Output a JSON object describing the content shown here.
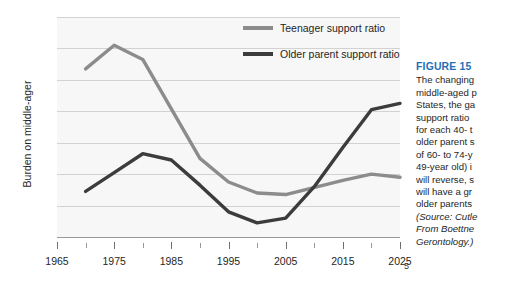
{
  "figure": {
    "caption_title": "FIGURE 15",
    "caption_body": "The changing\nmiddle-aged p\nStates, the ga\nsupport ratio\nfor each 40- t\nolder parent s\nof 60- to 74-y\n49-year old) i\nwill reverse, s\nwill have a gr\nolder parents",
    "caption_source": "(Source: Cutle\nFrom Boettne\nGerontology.)",
    "page_number": "5"
  },
  "legend": {
    "position": "inside-top-right",
    "items": [
      {
        "label": "Teenager support ratio",
        "color": "#8c8c8c"
      },
      {
        "label": "Older parent support ratio",
        "color": "#3c3c3c"
      }
    ]
  },
  "chart_data": {
    "type": "line",
    "title": "",
    "xlabel": "",
    "ylabel": "Burden on middle-ager",
    "xlim": [
      1965,
      2025
    ],
    "ylim": [
      0.6,
      2.0
    ],
    "ytick_labels": [
      "2.0",
      "1.8",
      "1.6",
      "1.4",
      "1.2",
      "1.0",
      "0.8",
      "0.6"
    ],
    "ytick_values": [
      2.0,
      1.8,
      1.6,
      1.4,
      1.2,
      1.0,
      0.8,
      0.6
    ],
    "xtick_labels": [
      "1965",
      "1975",
      "1985",
      "1995",
      "2005",
      "2015",
      "2025"
    ],
    "xtick_values": [
      1965,
      1975,
      1985,
      1995,
      2005,
      2015,
      2025
    ],
    "xtick_minor_values": [
      1970,
      1980,
      1990,
      2000,
      2010,
      2020
    ],
    "grid": "horizontal",
    "plot_background": "#f7f7f7",
    "series": [
      {
        "name": "Teenager support ratio",
        "color": "#8c8c8c",
        "x": [
          1970,
          1975,
          1980,
          1990,
          1995,
          2000,
          2005,
          2015,
          2020,
          2025
        ],
        "values": [
          1.67,
          1.82,
          1.73,
          1.1,
          0.95,
          0.88,
          0.87,
          0.96,
          1.0,
          0.98
        ]
      },
      {
        "name": "Older parent support ratio",
        "color": "#3c3c3c",
        "x": [
          1970,
          1975,
          1980,
          1985,
          1990,
          1995,
          2000,
          2005,
          2010,
          2015,
          2020,
          2025
        ],
        "values": [
          0.89,
          1.01,
          1.13,
          1.09,
          0.93,
          0.76,
          0.69,
          0.72,
          0.92,
          1.17,
          1.41,
          1.45
        ]
      }
    ]
  }
}
